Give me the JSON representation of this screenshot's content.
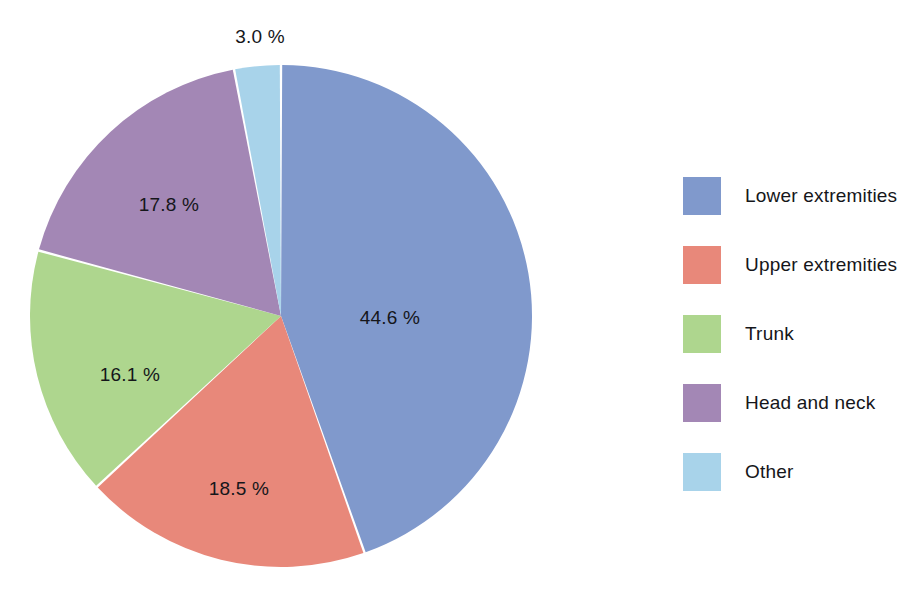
{
  "chart_data": {
    "type": "pie",
    "title": "",
    "subtitle": "",
    "xlabel": "",
    "ylabel": "",
    "grid": false,
    "legend_position": "right",
    "start_angle_deg": 0,
    "direction": "clockwise",
    "unit": "%",
    "categories": [
      "Lower extremities",
      "Upper extremities",
      "Trunk",
      "Head and neck",
      "Other"
    ],
    "values": [
      44.6,
      18.5,
      16.1,
      17.8,
      3.0
    ],
    "labels": [
      "44.6 %",
      "18.5 %",
      "16.1 %",
      "17.8 %",
      "3.0 %"
    ],
    "colors": [
      "#8099cc",
      "#e8887a",
      "#aed68e",
      "#a387b5",
      "#a8d3ea"
    ],
    "slices": [
      {
        "name": "Lower extremities",
        "value": 44.6,
        "label": "44.6 %",
        "color": "#8099cc",
        "label_position": "inside",
        "label_x": 390,
        "label_y": 318
      },
      {
        "name": "Upper extremities",
        "value": 18.5,
        "label": "18.5 %",
        "color": "#e8887a",
        "label_position": "inside",
        "label_x": 239,
        "label_y": 489
      },
      {
        "name": "Trunk",
        "value": 16.1,
        "label": "16.1 %",
        "color": "#aed68e",
        "label_position": "inside",
        "label_x": 130,
        "label_y": 375
      },
      {
        "name": "Head and neck",
        "value": 17.8,
        "label": "17.8 %",
        "color": "#a387b5",
        "label_position": "inside",
        "label_x": 169,
        "label_y": 205
      },
      {
        "name": "Other",
        "value": 3.0,
        "label": "3.0 %",
        "color": "#a8d3ea",
        "label_position": "outside",
        "label_x": 260,
        "label_y": 37
      }
    ]
  },
  "legend": {
    "items": [
      {
        "label": "Lower extremities",
        "color": "#8099cc"
      },
      {
        "label": "Upper extremities",
        "color": "#e8887a"
      },
      {
        "label": "Trunk",
        "color": "#aed68e"
      },
      {
        "label": "Head and neck",
        "color": "#a387b5"
      },
      {
        "label": "Other",
        "color": "#a8d3ea"
      }
    ]
  },
  "geometry": {
    "center_x": 281,
    "center_y": 316,
    "radius": 251,
    "background": "#ffffff"
  }
}
